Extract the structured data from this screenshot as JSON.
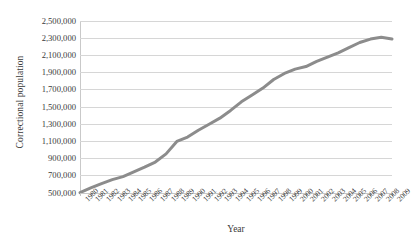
{
  "chart_data": {
    "type": "line",
    "title": "",
    "xlabel": "Year",
    "ylabel": "Correctional population",
    "grid": true,
    "legend": false,
    "legend_position": "none",
    "line_color": "#8c8c8c",
    "gridline_color": "#d6d6d6",
    "axis_color": "#c9c9c9",
    "background_color": "#ffffff",
    "xlim": [
      1980,
      2009
    ],
    "ylim": [
      500000,
      2500000
    ],
    "ytick_step": 200000,
    "ytick_labels": [
      "2,500,000",
      "2,300,000",
      "2,100,000",
      "1,900,000",
      "1,700,000",
      "1,500,000",
      "1,300,000",
      "1,100,000",
      "900,000",
      "700,000",
      "500,000"
    ],
    "ytick_values": [
      2500000,
      2300000,
      2100000,
      1900000,
      1700000,
      1500000,
      1300000,
      1100000,
      900000,
      700000,
      500000
    ],
    "categories": [
      "1980",
      "1981",
      "1982",
      "1983",
      "1984",
      "1985",
      "1986",
      "1987",
      "1988",
      "1989",
      "1990",
      "1991",
      "1992",
      "1993",
      "1994",
      "1995",
      "1996",
      "1997",
      "1998",
      "1999",
      "2000",
      "2001",
      "2002",
      "2003",
      "2004",
      "2005",
      "2006",
      "2007",
      "2008",
      "2009"
    ],
    "x": [
      1980,
      1981,
      1982,
      1983,
      1984,
      1985,
      1986,
      1987,
      1988,
      1989,
      1990,
      1991,
      1992,
      1993,
      1994,
      1995,
      1996,
      1997,
      1998,
      1999,
      2000,
      2001,
      2002,
      2003,
      2004,
      2005,
      2006,
      2007,
      2008,
      2009
    ],
    "values": [
      505000,
      560000,
      610000,
      655000,
      690000,
      745000,
      800000,
      860000,
      955000,
      1100000,
      1150000,
      1230000,
      1300000,
      1370000,
      1460000,
      1560000,
      1640000,
      1720000,
      1820000,
      1890000,
      1940000,
      1970000,
      2030000,
      2080000,
      2130000,
      2190000,
      2250000,
      2290000,
      2310000,
      2290000
    ],
    "units": "persons"
  }
}
